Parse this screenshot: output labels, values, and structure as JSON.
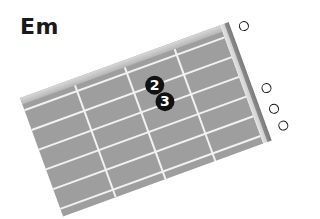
{
  "chord": {
    "name": "Em",
    "strings": 6,
    "frets_shown": 4,
    "fingers": [
      {
        "string": 2,
        "fret": 2,
        "label": "2"
      },
      {
        "string": 3,
        "fret": 2,
        "label": "3"
      }
    ],
    "open_strings": [
      1,
      4,
      5,
      6
    ]
  },
  "colors": {
    "fretboard": "#9e9e9e",
    "lines": "#f2f2f2",
    "marker": "#111111",
    "marker_text": "#ffffff"
  }
}
